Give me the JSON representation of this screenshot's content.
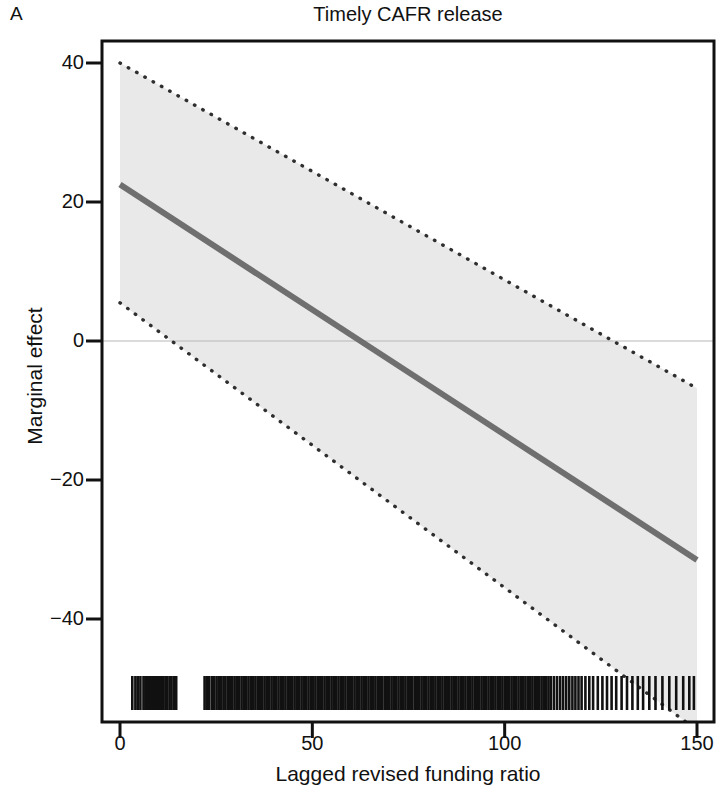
{
  "panel": {
    "label": "A"
  },
  "header": {
    "title": "Timely CAFR release"
  },
  "axes": {
    "x": {
      "label": "Lagged revised funding ratio",
      "ticks": [
        0,
        50,
        100,
        150
      ],
      "tick_labels": [
        "0",
        "50",
        "100",
        "150"
      ],
      "min": 0,
      "max": 150
    },
    "y": {
      "label": "Marginal effect",
      "ticks": [
        40,
        20,
        0,
        -20,
        -40
      ],
      "tick_labels": [
        "40",
        "20",
        "0",
        "−20",
        "−40"
      ],
      "min": -56,
      "max": 44
    }
  },
  "style": {
    "line_color": "#6f6f6f",
    "band_fill": "#e9e9e9",
    "band_edge_color": "#3a3a3a",
    "zero_line_color": "#b8b8b8",
    "axis_color": "#111111",
    "rug_color": "#111111"
  },
  "chart_data": {
    "type": "line",
    "title": "Timely CAFR release",
    "xlabel": "Lagged revised funding ratio",
    "ylabel": "Marginal effect",
    "xlim": [
      0,
      150
    ],
    "ylim": [
      -56,
      44
    ],
    "grid": false,
    "legend": "none",
    "annotations": [
      "A"
    ],
    "reference_lines": [
      {
        "axis": "y",
        "value": 0,
        "style": "solid-thin-gray"
      }
    ],
    "x": [
      0,
      150
    ],
    "series": [
      {
        "name": "Marginal effect",
        "type": "line",
        "style": "solid",
        "values": [
          22.5,
          -31.5
        ]
      },
      {
        "name": "Upper 95% CI",
        "type": "line",
        "style": "dotted",
        "values": [
          40.0,
          -6.8
        ]
      },
      {
        "name": "Lower 95% CI",
        "type": "line",
        "style": "dotted",
        "values": [
          5.5,
          -56.0
        ]
      }
    ],
    "confidence_band": {
      "label": "95% confidence interval",
      "x": [
        0,
        150
      ],
      "upper": [
        40.0,
        -6.8
      ],
      "lower": [
        5.5,
        -56.0
      ]
    },
    "zero_crossing_x": 64.5,
    "rug": {
      "label": "Distribution of lagged revised funding ratio",
      "position": "bottom",
      "values": [
        3.2,
        4.0,
        4.6,
        5.3,
        6.1,
        6.6,
        7.0,
        7.5,
        7.9,
        8.4,
        8.8,
        9.2,
        9.6,
        10.1,
        10.6,
        11.2,
        11.8,
        12.3,
        12.9,
        13.4,
        14.0,
        14.6,
        22.0,
        22.6,
        23.2,
        23.9,
        24.5,
        25.1,
        25.7,
        26.3,
        26.9,
        27.4,
        28.0,
        28.6,
        29.2,
        29.8,
        30.4,
        31.0,
        31.6,
        32.2,
        32.8,
        33.4,
        34.0,
        34.6,
        35.2,
        35.8,
        36.4,
        37.0,
        37.6,
        38.2,
        38.8,
        39.4,
        40.0,
        40.6,
        41.2,
        41.8,
        42.4,
        43.0,
        43.6,
        44.2,
        44.8,
        45.4,
        46.0,
        46.6,
        47.2,
        47.8,
        48.4,
        49.0,
        49.6,
        50.2,
        50.8,
        51.4,
        52.0,
        52.6,
        53.2,
        53.8,
        54.4,
        55.0,
        55.6,
        56.2,
        56.8,
        57.4,
        58.0,
        58.6,
        59.2,
        59.8,
        60.4,
        61.0,
        61.6,
        62.2,
        62.8,
        63.4,
        64.0,
        64.6,
        65.2,
        65.8,
        66.4,
        67.0,
        67.6,
        68.2,
        68.8,
        69.4,
        70.0,
        70.6,
        71.2,
        71.8,
        72.4,
        73.0,
        73.6,
        74.2,
        74.8,
        75.4,
        76.0,
        76.6,
        77.2,
        77.8,
        78.4,
        79.0,
        79.6,
        80.2,
        80.8,
        81.4,
        82.0,
        82.6,
        83.2,
        83.8,
        84.4,
        85.0,
        85.6,
        86.2,
        86.8,
        87.4,
        88.0,
        88.6,
        89.2,
        89.8,
        90.4,
        91.0,
        91.6,
        92.2,
        92.8,
        93.4,
        94.0,
        94.6,
        95.2,
        95.8,
        96.4,
        97.0,
        97.6,
        98.2,
        98.8,
        99.4,
        100.0,
        100.6,
        101.2,
        101.8,
        102.4,
        103.0,
        103.6,
        104.2,
        104.8,
        105.4,
        106.0,
        106.6,
        107.2,
        107.8,
        108.4,
        109.0,
        109.6,
        110.2,
        110.8,
        111.4,
        112.0,
        112.8,
        113.6,
        114.4,
        115.2,
        116.0,
        116.8,
        117.6,
        118.4,
        119.2,
        120.0,
        121.0,
        122.0,
        123.0,
        124.2,
        125.4,
        126.6,
        127.8,
        129.0,
        130.4,
        131.8,
        133.2,
        134.6,
        136.0,
        137.6,
        139.2,
        141.0,
        142.8,
        144.6,
        146.4,
        148.0,
        149.2
      ]
    }
  }
}
